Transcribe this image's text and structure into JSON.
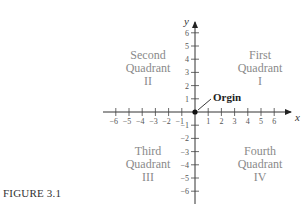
{
  "figure": {
    "caption": "FIGURE 3.1"
  },
  "quadrants": [
    {
      "name": "First",
      "word": "Quadrant",
      "numeral": "I"
    },
    {
      "name": "Second",
      "word": "Quadrant",
      "numeral": "II"
    },
    {
      "name": "Third",
      "word": "Quadrant",
      "numeral": "III"
    },
    {
      "name": "Fourth",
      "word": "Quadrant",
      "numeral": "IV"
    }
  ],
  "axes": {
    "x_label": "x",
    "y_label": "y",
    "origin_label": "Orgin",
    "x_ticks": [
      -6,
      -5,
      -4,
      -3,
      -2,
      -1,
      1,
      2,
      3,
      4,
      5,
      6
    ],
    "y_ticks": [
      6,
      5,
      4,
      3,
      2,
      1,
      -1,
      -2,
      -3,
      -4,
      -5,
      -6
    ]
  },
  "chart_data": {
    "type": "scatter",
    "title": "",
    "xlabel": "x",
    "ylabel": "y",
    "xlim": [
      -6,
      6
    ],
    "ylim": [
      -6,
      6
    ],
    "x": [
      0
    ],
    "y": [
      0
    ],
    "annotations": [
      "Orgin",
      "First Quadrant I",
      "Second Quadrant II",
      "Third Quadrant III",
      "Fourth Quadrant IV"
    ],
    "grid": false
  }
}
